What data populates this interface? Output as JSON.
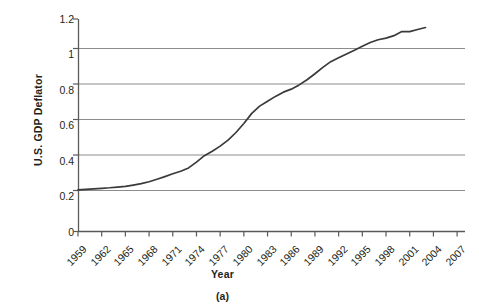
{
  "chart_data": {
    "type": "line",
    "title": "",
    "subtitle": "",
    "panel_label": "(a)",
    "xlabel": "Year",
    "ylabel": "U.S. GDP Deflator",
    "xlim": [
      1959,
      2008
    ],
    "ylim": [
      0,
      1.2
    ],
    "grid": "horizontal",
    "legend": "none",
    "y_ticks": [
      "0",
      "0.2",
      "0.4",
      "0.6",
      "0.8",
      "1",
      "1.2"
    ],
    "y_tick_values": [
      0,
      0.2,
      0.4,
      0.6,
      0.8,
      1.0,
      1.2
    ],
    "x_ticks": [
      "1959",
      "1962",
      "1965",
      "1968",
      "1971",
      "1974",
      "1977",
      "1980",
      "1983",
      "1986",
      "1989",
      "1992",
      "1995",
      "1998",
      "2001",
      "2004",
      "2007"
    ],
    "x_tick_values": [
      1959,
      1962,
      1965,
      1968,
      1971,
      1974,
      1977,
      1980,
      1983,
      1986,
      1989,
      1992,
      1995,
      1998,
      2001,
      2004,
      2007
    ],
    "series": [
      {
        "name": "U.S. GDP Deflator",
        "color": "#3a3a3a",
        "x": [
          1959,
          1960,
          1961,
          1962,
          1963,
          1964,
          1965,
          1966,
          1967,
          1968,
          1969,
          1970,
          1971,
          1972,
          1973,
          1974,
          1975,
          1976,
          1977,
          1978,
          1979,
          1980,
          1981,
          1982,
          1983,
          1984,
          1985,
          1986,
          1987,
          1988,
          1989,
          1990,
          1991,
          1992,
          1993,
          1994,
          1995,
          1996,
          1997,
          1998,
          1999,
          2000,
          2001,
          2002,
          2003
        ],
        "y": [
          0.235,
          0.238,
          0.241,
          0.244,
          0.247,
          0.251,
          0.255,
          0.262,
          0.27,
          0.281,
          0.295,
          0.31,
          0.326,
          0.34,
          0.359,
          0.392,
          0.428,
          0.453,
          0.482,
          0.516,
          0.559,
          0.61,
          0.667,
          0.708,
          0.736,
          0.763,
          0.787,
          0.804,
          0.828,
          0.857,
          0.891,
          0.927,
          0.959,
          0.981,
          1.003,
          1.024,
          1.046,
          1.067,
          1.083,
          1.092,
          1.106,
          1.129,
          1.129,
          1.141,
          1.152
        ]
      }
    ]
  },
  "figure": {
    "y_axis_title": "U.S. GDP Deflator",
    "x_axis_title": "Year",
    "caption": "(a)"
  },
  "colors": {
    "line": "#3a3a3a",
    "gridline": "#8c8c8c",
    "axis": "#5a5a5a",
    "text": "#231f20",
    "background": "#ffffff"
  }
}
